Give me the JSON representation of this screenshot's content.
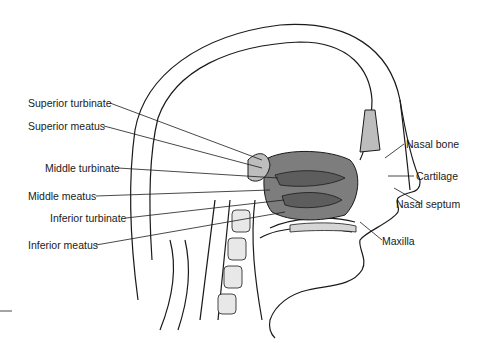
{
  "diagram": {
    "labels_left": [
      {
        "id": "superior-turbinate",
        "text": "Superior turbinate"
      },
      {
        "id": "superior-meatus",
        "text": "Superior meatus"
      },
      {
        "id": "middle-turbinate",
        "text": "Middle turbinate"
      },
      {
        "id": "middle-meatus",
        "text": "Middle meatus"
      },
      {
        "id": "inferior-turbinate",
        "text": "Inferior turbinate"
      },
      {
        "id": "inferior-meatus",
        "text": "Inferior meatus"
      }
    ],
    "labels_right": [
      {
        "id": "nasal-bone",
        "text": "Nasal bone"
      },
      {
        "id": "cartilage",
        "text": "Cartilage"
      },
      {
        "id": "nasal-septum",
        "text": "Nasal septum"
      },
      {
        "id": "maxilla",
        "text": "Maxilla"
      }
    ],
    "colors": {
      "line": "#1a1a1a",
      "cavity_fill": "#7d7d7d",
      "bone_fill": "#bdbdbd"
    }
  }
}
